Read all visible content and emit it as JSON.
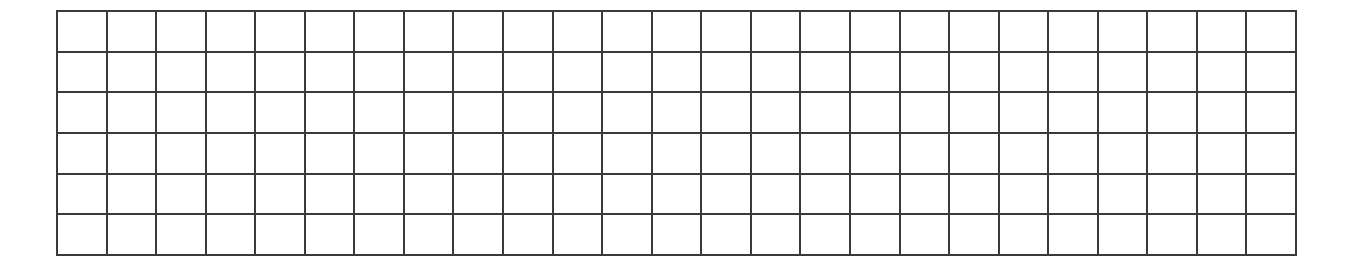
{
  "grid": {
    "rows": 6,
    "columns": 25,
    "line_color": "#3a3a3a",
    "background_color": "#ffffff",
    "cells_filled": false
  }
}
